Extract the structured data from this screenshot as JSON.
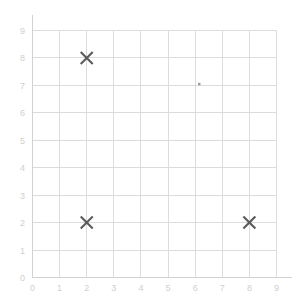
{
  "chart_data": {
    "type": "scatter",
    "title": "",
    "subtitle": "",
    "xlabel": "",
    "ylabel": "",
    "xlim": [
      0,
      9
    ],
    "ylim": [
      0,
      9
    ],
    "xticks": [
      0,
      1,
      2,
      3,
      4,
      5,
      6,
      7,
      8,
      9
    ],
    "yticks": [
      0,
      1,
      2,
      3,
      4,
      5,
      6,
      7,
      8,
      9
    ],
    "xtick_labels": [
      "0",
      "1",
      "2",
      "3",
      "4",
      "5",
      "6",
      "7",
      "8",
      "9"
    ],
    "ytick_labels": [
      "0",
      "1",
      "2",
      "3",
      "4",
      "5",
      "6",
      "7",
      "8",
      "9"
    ],
    "grid": true,
    "legend": false,
    "legend_position": "none",
    "marker": "x",
    "marker_color": "#5a5a5a",
    "grid_color": "#dcdcdc",
    "axis_color": "#d2d2d2",
    "tick_label_color": "#cfcfcf",
    "background_color": "#ffffff",
    "series": [
      {
        "name": "points",
        "marker": "x",
        "color": "#5a5a5a",
        "points": [
          {
            "x": 2,
            "y": 8,
            "label": "(2, 8)"
          },
          {
            "x": 2,
            "y": 2,
            "label": "(2, 2)"
          },
          {
            "x": 8,
            "y": 2,
            "label": "(8, 2)"
          }
        ]
      },
      {
        "name": "stray-mark",
        "marker": "dot",
        "color": "#9a9a9a",
        "points": [
          {
            "x": 6.15,
            "y": 7.05,
            "label": ""
          }
        ]
      }
    ]
  },
  "axes": {
    "x_axis_name": "x-axis",
    "y_axis_name": "y-axis"
  }
}
